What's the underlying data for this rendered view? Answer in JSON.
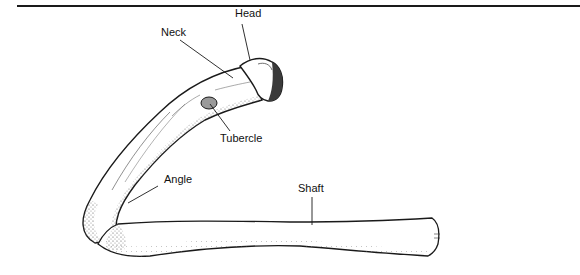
{
  "figure": {
    "labels": {
      "head": "Head",
      "neck": "Neck",
      "tubercle": "Tubercle",
      "angle": "Angle",
      "shaft": "Shaft"
    }
  },
  "colors": {
    "ink": "#1a1a1a",
    "background": "#ffffff",
    "shade": "#6b6b6b"
  }
}
